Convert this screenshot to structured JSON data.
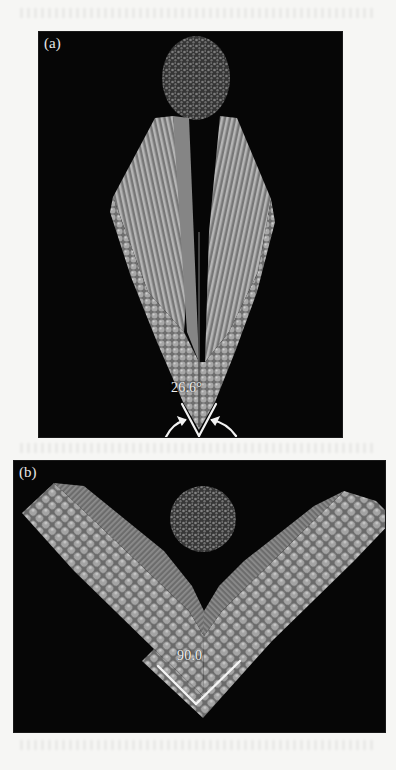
{
  "figure": {
    "panels": [
      {
        "id": "a",
        "label": "(a)",
        "angle_label": "26.6°",
        "description": "Two crystalline slabs forming a narrow V-shaped wedge with a disordered nanocluster above"
      },
      {
        "id": "b",
        "label": "(b)",
        "angle_label": "90.0",
        "description": "Two crystalline slabs forming a right-angle V-shaped wedge with a disordered nanocluster in the opening"
      }
    ],
    "colors": {
      "background": "#060606",
      "atoms": "#9a9a9a",
      "slab_face": "#7a7a7a",
      "annotation": "#f0f0f0",
      "page": "#f6f6f4"
    }
  }
}
